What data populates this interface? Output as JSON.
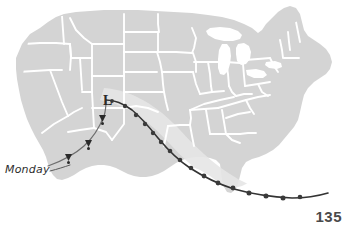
{
  "page": {
    "number": "135",
    "background_color": "#ffffff"
  },
  "map": {
    "title": "United States storm track map",
    "land_fill": "#d4d4d4",
    "border_color": "#ffffff",
    "water_fill": "#ffffff",
    "shading_band_fill": "#e6e6e6",
    "regions": [
      "Pacific Northwest",
      "California",
      "Great Basin",
      "Southwest",
      "Rocky Mountains",
      "Great Plains",
      "Midwest",
      "Great Lakes",
      "Northeast",
      "Southeast",
      "Gulf Coast",
      "Texas",
      "Florida"
    ]
  },
  "storm_track": {
    "line_color": "#3a3a3a",
    "dot_color": "#3a3a3a",
    "low_pressure_symbol": "L",
    "low_pressure_label": "low-pressure center",
    "position_dots_count": 16,
    "pennant_markers_count": 3
  },
  "annotations": {
    "monday": {
      "label": "Monday",
      "leader_line": true,
      "color": "#2e2e2e"
    }
  }
}
